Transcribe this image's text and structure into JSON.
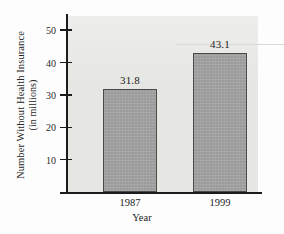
{
  "chart_data": {
    "type": "bar",
    "title": "",
    "xlabel": "Year",
    "ylabel_line1": "Number Without Health Insurance",
    "ylabel_line2": "(in millions)",
    "categories": [
      "1987",
      "1999"
    ],
    "values": [
      31.8,
      43.1
    ],
    "value_labels": [
      "31.8",
      "43.1"
    ],
    "ylim": [
      0,
      55
    ],
    "yticks": [
      10,
      20,
      30,
      40,
      50
    ],
    "ytick_labels": [
      "10",
      "20",
      "30",
      "40",
      "50"
    ],
    "grid": false,
    "legend": null,
    "bar_color": "#9b9b9b",
    "bar_edge_color": "#4a4a4a",
    "panel_color": "#e6e6e3",
    "axis_color": "#1b1b1b"
  }
}
